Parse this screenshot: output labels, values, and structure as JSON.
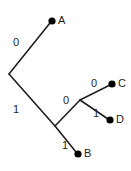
{
  "diagram": {
    "type": "phylogenetic-tree",
    "title": "",
    "background_color": "#ffffff",
    "line_color": "#231f20",
    "node_color": "#000000",
    "leaves": [
      {
        "id": "A",
        "label": "A",
        "dot_x": 52,
        "dot_y": 21,
        "label_x": 58,
        "label_y": 21
      },
      {
        "id": "C",
        "label": "C",
        "dot_x": 112,
        "dot_y": 84,
        "label_x": 118,
        "label_y": 84
      },
      {
        "id": "D",
        "label": "D",
        "dot_x": 110,
        "dot_y": 120,
        "label_x": 116,
        "label_y": 120
      },
      {
        "id": "B",
        "label": "B",
        "dot_x": 78,
        "dot_y": 154,
        "label_x": 84,
        "label_y": 154
      }
    ],
    "internal_nodes": [
      {
        "id": "root",
        "x": 9,
        "y": 74
      },
      {
        "id": "n1",
        "x": 55,
        "y": 126
      },
      {
        "id": "n2",
        "x": 80,
        "y": 100
      }
    ],
    "edges": [
      {
        "id": "root-A",
        "from": "root",
        "to": "A",
        "x1": 9,
        "y1": 74,
        "x2": 50,
        "y2": 23,
        "label": "0",
        "label_x": 16,
        "label_y": 43
      },
      {
        "id": "root-n1",
        "from": "root",
        "to": "n1",
        "x1": 9,
        "y1": 74,
        "x2": 55,
        "y2": 126,
        "label": "1",
        "label_x": 16,
        "label_y": 110
      },
      {
        "id": "n1-B",
        "from": "n1",
        "to": "B",
        "x1": 55,
        "y1": 126,
        "x2": 76,
        "y2": 152,
        "label": "1",
        "label_x": 65,
        "label_y": 146
      },
      {
        "id": "n1-n2",
        "from": "n1",
        "to": "n2",
        "x1": 55,
        "y1": 126,
        "x2": 80,
        "y2": 100,
        "label": "0",
        "label_x": 66,
        "label_y": 101
      },
      {
        "id": "n2-C",
        "from": "n2",
        "to": "C",
        "x1": 80,
        "y1": 100,
        "x2": 110,
        "y2": 85,
        "label": "0",
        "label_x": 94,
        "label_y": 84
      },
      {
        "id": "n2-D",
        "from": "n2",
        "to": "D",
        "x1": 80,
        "y1": 100,
        "x2": 108,
        "y2": 119,
        "label": "1",
        "label_x": 96,
        "label_y": 114
      }
    ]
  }
}
